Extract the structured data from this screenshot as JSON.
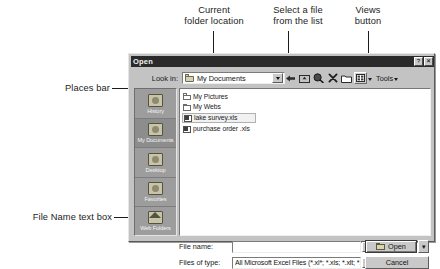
{
  "annotations": [
    {
      "id": "current-folder-location",
      "text": "Current\nfolder location"
    },
    {
      "id": "select-a-file",
      "text": "Select a file\nfrom the list"
    },
    {
      "id": "views-button",
      "text": "Views\nbutton"
    },
    {
      "id": "places-bar",
      "text": "Places bar"
    },
    {
      "id": "file-name-text-box",
      "text": "File Name text box"
    }
  ],
  "dialog": {
    "title": "Open",
    "title_buttons": [
      {
        "name": "help-button",
        "glyph": "?"
      },
      {
        "name": "close-button",
        "glyph": "✕"
      }
    ],
    "look_in": {
      "label": "Look in:",
      "value": "My Documents",
      "icon": "folder-icon"
    },
    "toolbar": {
      "items": [
        {
          "name": "back-button",
          "icon": "back-arrow-icon",
          "label": ""
        },
        {
          "name": "up-one-level-button",
          "icon": "up-folder-icon",
          "label": ""
        },
        {
          "name": "search-web-button",
          "icon": "search-globe-icon",
          "label": ""
        },
        {
          "name": "delete-button",
          "icon": "delete-x-icon",
          "label": ""
        },
        {
          "name": "new-folder-button",
          "icon": "new-folder-icon",
          "label": ""
        },
        {
          "name": "views-button",
          "icon": "views-icon",
          "label": ""
        },
        {
          "name": "tools-menu",
          "icon": "tools-icon",
          "label": "Tools"
        }
      ]
    },
    "places_bar": {
      "items": [
        {
          "label": "History",
          "icon": "history-icon",
          "selected": false
        },
        {
          "label": "My Documents",
          "icon": "my-documents-icon",
          "selected": true
        },
        {
          "label": "Desktop",
          "icon": "desktop-icon",
          "selected": false
        },
        {
          "label": "Favorites",
          "icon": "favorites-icon",
          "selected": false
        },
        {
          "label": "Web Folders",
          "icon": "web-folders-icon",
          "selected": false
        }
      ]
    },
    "file_list": {
      "items": [
        {
          "name": "My Pictures",
          "icon": "folder-icon",
          "selected": false
        },
        {
          "name": "My Webs",
          "icon": "folder-icon",
          "selected": false
        },
        {
          "name": "lake survey.xls",
          "icon": "excel-file-icon",
          "selected": true
        },
        {
          "name": "purchase order .xls",
          "icon": "excel-file-icon",
          "selected": false
        }
      ]
    },
    "file_name": {
      "label": "File name:",
      "value": "",
      "placeholder": ""
    },
    "files_of_type": {
      "label": "Files of type:",
      "value": "All Microsoft Excel Files (*.xl*; *.xls; *.xlt; *.htm; *.html)"
    },
    "buttons": {
      "open": "Open",
      "open_split_arrow": "▾",
      "cancel": "Cancel"
    }
  },
  "colors": {
    "dialog_face": "#c3c3c3",
    "titlebar": "#2a2a2a",
    "places_bar": "#9d9d9d",
    "list_background": "#ffffff",
    "annotation_text": "#1c1c1c"
  }
}
